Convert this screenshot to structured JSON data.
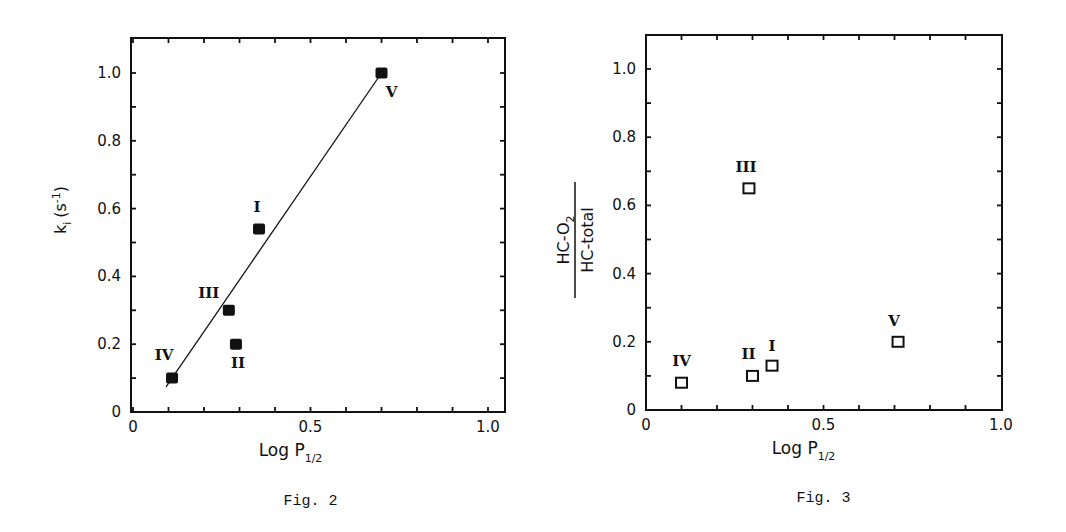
{
  "chart_data": [
    {
      "id": "fig2",
      "type": "scatter",
      "title": "",
      "caption": "Fig. 2",
      "xlabel": "Log P",
      "xlabel_sub": "1/2",
      "ylabel": "k",
      "ylabel_sub": "i",
      "ylabel_unit": "(s",
      "ylabel_unit_sup": "-1",
      "ylabel_unit_close": ")",
      "xlim": [
        0,
        1.05
      ],
      "ylim": [
        0,
        1.1
      ],
      "x_ticks": [
        0,
        0.1,
        0.2,
        0.3,
        0.4,
        0.5,
        0.6,
        0.7,
        0.8,
        0.9,
        1.0
      ],
      "x_tick_labels": [
        {
          "v": 0,
          "t": "0"
        },
        {
          "v": 0.5,
          "t": "0.5"
        },
        {
          "v": 1.0,
          "t": "1.0"
        }
      ],
      "y_ticks": [
        0,
        0.1,
        0.2,
        0.3,
        0.4,
        0.5,
        0.6,
        0.7,
        0.8,
        0.9,
        1.0
      ],
      "y_tick_labels": [
        {
          "v": 0,
          "t": "0"
        },
        {
          "v": 0.2,
          "t": "0.2"
        },
        {
          "v": 0.4,
          "t": "0.4"
        },
        {
          "v": 0.6,
          "t": "0.6"
        },
        {
          "v": 0.8,
          "t": "0.8"
        },
        {
          "v": 1.0,
          "t": "1.0"
        }
      ],
      "grid": false,
      "marker": "filled-square",
      "points": [
        {
          "label": "I",
          "x": 0.355,
          "y": 0.54,
          "label_dx": -2,
          "label_dy": -17
        },
        {
          "label": "II",
          "x": 0.29,
          "y": 0.2,
          "label_dx": 2,
          "label_dy": 24
        },
        {
          "label": "III",
          "x": 0.27,
          "y": 0.3,
          "label_dx": -20,
          "label_dy": -12
        },
        {
          "label": "IV",
          "x": 0.11,
          "y": 0.1,
          "label_dx": -8,
          "label_dy": -18
        },
        {
          "label": "V",
          "x": 0.7,
          "y": 1.0,
          "label_dx": 10,
          "label_dy": 24
        }
      ],
      "fit_line": {
        "x1": 0.093,
        "y1": 0.074,
        "x2": 0.7,
        "y2": 1.0
      }
    },
    {
      "id": "fig3",
      "type": "scatter",
      "title": "",
      "caption": "Fig. 3",
      "xlabel": "Log P",
      "xlabel_sub": "1/2",
      "ylabel_numerator": "HC-O",
      "ylabel_numerator_sub": "2",
      "ylabel_denominator": "HC-total",
      "xlim": [
        0,
        1.0
      ],
      "ylim": [
        0,
        1.1
      ],
      "x_ticks": [
        0,
        0.1,
        0.2,
        0.3,
        0.4,
        0.5,
        0.6,
        0.7,
        0.8,
        0.9,
        1.0
      ],
      "x_tick_labels": [
        {
          "v": 0,
          "t": "0"
        },
        {
          "v": 0.5,
          "t": "0.5"
        },
        {
          "v": 1.0,
          "t": "1.0"
        }
      ],
      "y_ticks": [
        0,
        0.1,
        0.2,
        0.3,
        0.4,
        0.5,
        0.6,
        0.7,
        0.8,
        0.9,
        1.0
      ],
      "y_tick_labels": [
        {
          "v": 0,
          "t": "0"
        },
        {
          "v": 0.2,
          "t": "0.2"
        },
        {
          "v": 0.4,
          "t": "0.4"
        },
        {
          "v": 0.6,
          "t": "0.6"
        },
        {
          "v": 0.8,
          "t": "0.8"
        },
        {
          "v": 1.0,
          "t": "1.0"
        }
      ],
      "grid": false,
      "marker": "open-square",
      "points": [
        {
          "label": "I",
          "x": 0.355,
          "y": 0.13,
          "label_dx": 0,
          "label_dy": -15
        },
        {
          "label": "II",
          "x": 0.3,
          "y": 0.1,
          "label_dx": -4,
          "label_dy": -17
        },
        {
          "label": "III",
          "x": 0.29,
          "y": 0.65,
          "label_dx": -3,
          "label_dy": -16
        },
        {
          "label": "IV",
          "x": 0.1,
          "y": 0.08,
          "label_dx": 0,
          "label_dy": -17
        },
        {
          "label": "V",
          "x": 0.71,
          "y": 0.2,
          "label_dx": -4,
          "label_dy": -16
        }
      ]
    }
  ],
  "layout": {
    "fig2": {
      "x0": 133,
      "x1per": 355,
      "y0": 412,
      "y1per": 339,
      "frame": [
        131,
        38,
        505,
        412
      ]
    },
    "fig3": {
      "x0": 646,
      "x1per": 355,
      "y0": 410,
      "y1per": 341,
      "frame": [
        646,
        35,
        1002,
        410
      ]
    }
  }
}
